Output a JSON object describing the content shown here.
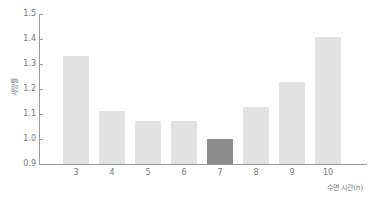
{
  "chart_data": {
    "type": "bar",
    "title": "",
    "xlabel": "수면 시간(h)",
    "ylabel": "사망률",
    "categories": [
      "3",
      "4",
      "5",
      "6",
      "7",
      "8",
      "9",
      "10"
    ],
    "values": [
      1.33,
      1.11,
      1.07,
      1.07,
      1.0,
      1.13,
      1.23,
      1.41
    ],
    "highlight_index": 4,
    "ylim": [
      0.9,
      1.5
    ],
    "yticks": [
      "1.5",
      "1.4",
      "1.3",
      "1.2",
      "1.1",
      "1.0",
      "0.9"
    ],
    "grid": false,
    "legend": null,
    "colors": {
      "bar": "#e2e2e2",
      "highlight": "#8c8c8c",
      "axis": "#9a9a9a"
    }
  }
}
